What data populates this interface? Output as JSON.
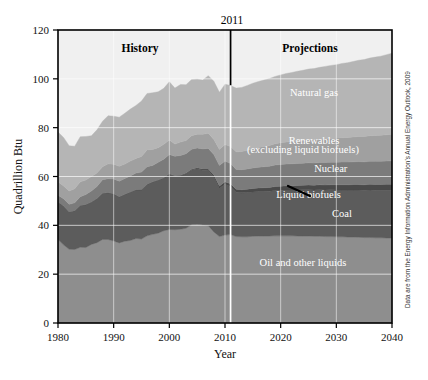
{
  "figure": {
    "source_note": "Data are from the Energy Information Administration's Annual Energy Outlook, 2009",
    "divider_year_label": "2011",
    "history_label": "History",
    "projections_label": "Projections"
  },
  "chart_data": {
    "type": "area",
    "stacked": true,
    "title": "",
    "xlabel": "Year",
    "ylabel": "Quadrillion Btu",
    "xlim": [
      1980,
      2040
    ],
    "ylim": [
      0,
      120
    ],
    "xticks": [
      1980,
      1990,
      2000,
      2010,
      2020,
      2030,
      2040
    ],
    "xticklabels": [
      "1980",
      "1990",
      "2000",
      "2010",
      "2020",
      "2030",
      "2040"
    ],
    "yticks": [
      0,
      20,
      40,
      60,
      80,
      100,
      120
    ],
    "yticklabels": [
      "0",
      "20",
      "40",
      "60",
      "80",
      "100",
      "120"
    ],
    "grid": false,
    "legend": "inline-labels",
    "divider_x": 2011,
    "annotations": [
      {
        "text": "History",
        "x": 1995,
        "y": 113,
        "bold": true
      },
      {
        "text": "Projections",
        "x": 2027,
        "y": 113,
        "bold": true
      },
      {
        "text": "2011",
        "x": 2011,
        "y": 123
      }
    ],
    "x": [
      1980,
      1981,
      1982,
      1983,
      1984,
      1985,
      1986,
      1987,
      1988,
      1989,
      1990,
      1991,
      1992,
      1993,
      1994,
      1995,
      1996,
      1997,
      1998,
      1999,
      2000,
      2001,
      2002,
      2003,
      2004,
      2005,
      2006,
      2007,
      2008,
      2009,
      2010,
      2011,
      2012,
      2013,
      2014,
      2015,
      2016,
      2017,
      2018,
      2019,
      2020,
      2021,
      2022,
      2023,
      2024,
      2025,
      2026,
      2027,
      2028,
      2029,
      2030,
      2031,
      2032,
      2033,
      2034,
      2035,
      2036,
      2037,
      2038,
      2039,
      2040
    ],
    "series": [
      {
        "name": "Oil and other liquids",
        "color": "#8e8e8e",
        "values": [
          34.2,
          32.0,
          30.2,
          30.1,
          31.0,
          30.9,
          32.2,
          32.9,
          34.2,
          34.2,
          33.6,
          32.8,
          33.5,
          33.8,
          34.6,
          34.4,
          35.7,
          36.3,
          36.8,
          37.8,
          38.3,
          38.2,
          38.4,
          38.8,
          40.2,
          40.4,
          40.1,
          39.8,
          37.3,
          35.4,
          36.0,
          36.2,
          35.4,
          35.3,
          35.3,
          35.5,
          35.6,
          35.6,
          35.6,
          35.7,
          35.7,
          35.7,
          35.7,
          35.6,
          35.6,
          35.6,
          35.5,
          35.5,
          35.4,
          35.4,
          35.3,
          35.3,
          35.2,
          35.2,
          35.1,
          35.0,
          35.0,
          34.9,
          34.9,
          34.8,
          34.8
        ]
      },
      {
        "name": "Coal",
        "color": "#5c5c5c",
        "values": [
          15.4,
          15.9,
          15.3,
          15.9,
          17.1,
          17.5,
          17.3,
          18.0,
          18.8,
          19.1,
          19.2,
          18.8,
          19.1,
          19.8,
          19.9,
          20.1,
          21.0,
          21.4,
          21.7,
          21.6,
          22.6,
          21.9,
          21.9,
          22.3,
          22.5,
          22.8,
          22.5,
          22.7,
          22.4,
          19.7,
          20.8,
          19.6,
          18.2,
          18.0,
          18.2,
          18.2,
          18.3,
          18.3,
          18.4,
          18.6,
          18.7,
          18.8,
          18.8,
          18.9,
          19.0,
          19.0,
          19.0,
          19.1,
          19.1,
          19.2,
          19.2,
          19.2,
          19.3,
          19.3,
          19.4,
          19.4,
          19.5,
          19.5,
          19.5,
          19.6,
          19.6
        ]
      },
      {
        "name": "Liquid biofuels",
        "color": "#4a4a4a",
        "values": [
          0.0,
          0.0,
          0.0,
          0.0,
          0.0,
          0.1,
          0.1,
          0.1,
          0.1,
          0.1,
          0.1,
          0.1,
          0.1,
          0.1,
          0.1,
          0.2,
          0.1,
          0.1,
          0.1,
          0.1,
          0.2,
          0.2,
          0.2,
          0.3,
          0.3,
          0.4,
          0.5,
          0.6,
          0.9,
          1.0,
          1.1,
          1.2,
          1.2,
          1.3,
          1.3,
          1.4,
          1.4,
          1.5,
          1.5,
          1.6,
          1.6,
          1.7,
          1.7,
          1.8,
          1.8,
          1.9,
          1.9,
          2.0,
          2.0,
          2.0,
          2.1,
          2.1,
          2.1,
          2.2,
          2.2,
          2.2,
          2.3,
          2.3,
          2.3,
          2.4,
          2.4
        ]
      },
      {
        "name": "Nuclear",
        "color": "#7b7b7b",
        "values": [
          2.7,
          3.0,
          3.1,
          3.2,
          3.6,
          4.1,
          4.5,
          4.9,
          5.6,
          5.7,
          6.1,
          6.4,
          6.5,
          6.5,
          6.8,
          7.1,
          7.2,
          6.7,
          7.2,
          7.6,
          7.9,
          8.0,
          8.1,
          7.9,
          8.2,
          8.1,
          8.2,
          8.4,
          8.4,
          8.4,
          8.4,
          8.3,
          8.1,
          8.2,
          8.3,
          8.4,
          8.5,
          8.6,
          8.7,
          8.8,
          8.9,
          8.9,
          9.0,
          9.0,
          9.0,
          9.1,
          9.1,
          9.1,
          9.2,
          9.2,
          9.2,
          9.3,
          9.3,
          9.3,
          9.4,
          9.4,
          9.4,
          9.5,
          9.5,
          9.5,
          9.6
        ]
      },
      {
        "name": "Renewables (excluding liquid biofuels)",
        "color": "#a0a0a0",
        "values": [
          5.5,
          5.2,
          5.5,
          5.8,
          6.1,
          6.0,
          5.9,
          5.5,
          5.3,
          6.1,
          6.0,
          6.1,
          5.9,
          6.1,
          6.0,
          6.4,
          6.9,
          6.6,
          6.0,
          6.1,
          5.9,
          5.0,
          5.5,
          5.4,
          5.5,
          5.6,
          6.0,
          6.2,
          6.2,
          6.6,
          6.8,
          7.0,
          7.2,
          7.4,
          7.6,
          7.9,
          8.1,
          8.3,
          8.5,
          8.7,
          8.9,
          9.0,
          9.1,
          9.2,
          9.3,
          9.4,
          9.5,
          9.6,
          9.7,
          9.8,
          9.9,
          10.0,
          10.1,
          10.2,
          10.3,
          10.4,
          10.5,
          10.6,
          10.7,
          10.8,
          10.9
        ]
      },
      {
        "name": "Natural gas",
        "color": "#b5b5b5",
        "values": [
          20.4,
          19.9,
          18.5,
          17.4,
          18.5,
          17.8,
          16.7,
          17.7,
          18.6,
          19.7,
          19.7,
          20.1,
          20.8,
          21.3,
          21.7,
          22.7,
          23.1,
          23.2,
          22.9,
          22.9,
          23.9,
          22.9,
          23.6,
          22.9,
          23.0,
          22.6,
          22.2,
          23.6,
          23.8,
          23.4,
          24.7,
          25.0,
          26.1,
          26.3,
          26.6,
          26.8,
          27.0,
          27.2,
          27.4,
          27.6,
          27.8,
          28.1,
          28.3,
          28.6,
          28.8,
          29.0,
          29.2,
          29.4,
          29.7,
          29.9,
          30.1,
          30.4,
          30.6,
          30.9,
          31.2,
          31.5,
          31.8,
          32.1,
          32.4,
          32.8,
          33.2
        ]
      }
    ],
    "series_labels": [
      {
        "name": "Natural gas",
        "x": 2026,
        "y": 93
      },
      {
        "name": "Renewables",
        "x": 2026,
        "y": 73.5
      },
      {
        "name": "(excluding liquid biofuels)",
        "x": 2024,
        "y": 69.5
      },
      {
        "name": "Nuclear",
        "x": 2029,
        "y": 62
      },
      {
        "name": "Liquid biofuels",
        "x": 2025,
        "y": 51
      },
      {
        "name": "Coal",
        "x": 2031,
        "y": 43.5
      },
      {
        "name": "Oil and other liquids",
        "x": 2024,
        "y": 23.5
      }
    ]
  }
}
